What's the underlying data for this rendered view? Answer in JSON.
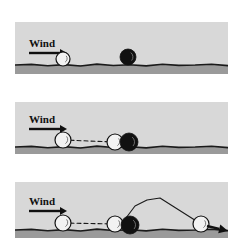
{
  "figure": {
    "width": 238,
    "height": 243,
    "background_color": "#ffffff",
    "panel_background_color": "#d8d8d8",
    "ground_band_color": "#9a9a9a",
    "ground_line_color": "#1a1a1a",
    "trajectory_color": "#1a1a1a",
    "white_particle_color": "#f2f2f2",
    "black_particle_color": "#111111",
    "panel_left": 15,
    "panel_width": 213
  },
  "panels": [
    {
      "id": "panel-1",
      "name": "initial-state",
      "top": 22,
      "height": 52,
      "wind_label": "Wind",
      "wind_label_x": 14,
      "wind_label_y": 16,
      "arrow": {
        "x1": 14,
        "y1": 31,
        "x2": 52,
        "y2": 31
      },
      "surface_y": 43,
      "particles": [
        {
          "name": "white-particle",
          "type": "white",
          "cx": 48,
          "cy": 37,
          "r": 7
        },
        {
          "name": "black-particle",
          "type": "black",
          "cx": 113,
          "cy": 35,
          "r": 8
        }
      ],
      "trajectory": []
    },
    {
      "id": "panel-2",
      "name": "impact-state",
      "top": 102,
      "height": 52,
      "wind_label": "Wind",
      "wind_label_x": 14,
      "wind_label_y": 12,
      "arrow": {
        "x1": 14,
        "y1": 27,
        "x2": 52,
        "y2": 27
      },
      "surface_y": 45,
      "particles": [
        {
          "name": "white-particle-start",
          "type": "white",
          "cx": 48,
          "cy": 38,
          "r": 8
        },
        {
          "name": "white-particle-impacting",
          "type": "white",
          "cx": 100,
          "cy": 40,
          "r": 8
        },
        {
          "name": "black-particle",
          "type": "black",
          "cx": 114,
          "cy": 40,
          "r": 9
        }
      ],
      "trajectory": [
        {
          "name": "dashed-path",
          "points": "48,38 100,40",
          "dashed": true
        }
      ]
    },
    {
      "id": "panel-3",
      "name": "ejection-state",
      "top": 182,
      "height": 56,
      "wind_label": "Wind",
      "wind_label_x": 14,
      "wind_label_y": 14,
      "arrow": {
        "x1": 14,
        "y1": 29,
        "x2": 52,
        "y2": 29
      },
      "surface_y": 48,
      "particles": [
        {
          "name": "white-particle-start",
          "type": "white",
          "cx": 48,
          "cy": 41,
          "r": 8
        },
        {
          "name": "white-particle-impacting",
          "type": "white",
          "cx": 100,
          "cy": 42,
          "r": 8
        },
        {
          "name": "black-particle",
          "type": "black",
          "cx": 115,
          "cy": 43,
          "r": 9
        },
        {
          "name": "white-particle-ejected",
          "type": "white",
          "cx": 186,
          "cy": 42,
          "r": 8
        }
      ],
      "trajectory": [
        {
          "name": "dashed-path",
          "points": "48,41 100,42",
          "dashed": true
        },
        {
          "name": "ejection-arc",
          "points": "108,40 120,24 132,18 145,16 186,42",
          "dashed": false
        }
      ],
      "exit_arrow": {
        "x1": 192,
        "y1": 44,
        "x2": 213,
        "y2": 49
      }
    }
  ]
}
